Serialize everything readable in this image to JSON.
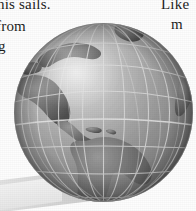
{
  "page": {
    "width": 196,
    "height": 211,
    "background_color": "#fdfdfd"
  },
  "text_fragments": [
    {
      "id": "sails",
      "text": "his sails.",
      "position": "top-left",
      "clipped": "top"
    },
    {
      "id": "from",
      "text": "from",
      "position": "left",
      "clipped": "left"
    },
    {
      "id": "g",
      "text": "g",
      "position": "left",
      "clipped": "left-bottom"
    },
    {
      "id": "like",
      "text": "Like",
      "position": "top-right",
      "clipped": "right"
    },
    {
      "id": "m",
      "text": "m",
      "position": "right",
      "clipped": "right"
    }
  ],
  "illustration": {
    "name": "globe",
    "type": "shaded-sphere",
    "style": "grayscale",
    "hemisphere_shown": "western",
    "continents": [
      "North America",
      "Central America",
      "South America",
      "Greenland"
    ],
    "graticule": {
      "visible": true,
      "meridian_count": 9,
      "parallel_count": 8,
      "line_color": "#d9d9d9"
    },
    "colors": {
      "ocean_light": "#c9c9c9",
      "ocean_mid": "#9b9b9b",
      "ocean_dark": "#6f6f6f",
      "land_light": "#8a8a8a",
      "land_mid": "#6b6b6b",
      "land_dark": "#555555",
      "highlight": "#dcdcdc",
      "terminator": "#5a5a5a",
      "shadow_plane": "#d7d7d7"
    },
    "light_source": "upper-left",
    "has_ground_shadow": true
  }
}
